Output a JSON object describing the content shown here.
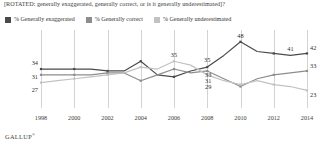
{
  "title": "[ROTATED: generally exaggerated, generally correct, or is it generally underestimated]?",
  "brand": "GALLUP",
  "brand_mark": "®",
  "colors": {
    "exaggerated": "#4a4a4a",
    "correct": "#8d8d8d",
    "underestimated": "#c2c2c2",
    "grid": "#d3d3d3",
    "text": "#2b2b2b"
  },
  "legend": [
    {
      "label": "% Generally exaggerated",
      "color": "#4a4a4a"
    },
    {
      "label": "% Generally correct",
      "color": "#8d8d8d"
    },
    {
      "label": "% Generally underestimated",
      "color": "#c2c2c2"
    }
  ],
  "chart_data": {
    "type": "line",
    "title": "[ROTATED: generally exaggerated, generally correct, or is it generally underestimated]?",
    "xlabel": "",
    "ylabel": "",
    "ylim": [
      15,
      52
    ],
    "grid": "vertical",
    "legend_position": "top",
    "x": [
      1998,
      1999,
      2000,
      2001,
      2002,
      2003,
      2004,
      2005,
      2006,
      2007,
      2008,
      2009,
      2010,
      2011,
      2012,
      2013,
      2014
    ],
    "xticks": [
      "1998",
      "2000",
      "2002",
      "2004",
      "2006",
      "2008",
      "2010",
      "2012",
      "2014"
    ],
    "series": [
      {
        "name": "% Generally exaggerated",
        "color": "#4a4a4a",
        "values": [
          34,
          34,
          34,
          34,
          33,
          33,
          38,
          31,
          30,
          33,
          35,
          41,
          48,
          43,
          42,
          41,
          42
        ],
        "labels": [
          {
            "x": 1998,
            "value": 34
          },
          {
            "x": 2008,
            "value": 35
          },
          {
            "x": 2010,
            "value": 48
          },
          {
            "x": 2013,
            "value": 41
          },
          {
            "x": 2014,
            "value": 42
          }
        ]
      },
      {
        "name": "% Generally correct",
        "color": "#8d8d8d",
        "values": [
          31,
          31,
          31,
          31,
          32,
          32,
          28,
          31,
          34,
          32,
          33,
          29,
          25,
          29,
          31,
          32,
          33
        ],
        "labels": [
          {
            "x": 1998,
            "value": 31
          },
          {
            "x": 2008,
            "value": 33
          },
          {
            "x": 2014,
            "value": 33
          }
        ]
      },
      {
        "name": "% Generally underestimated",
        "color": "#c2c2c2",
        "values": [
          27,
          28,
          29,
          30,
          31,
          32,
          35,
          34,
          38,
          36,
          31,
          28,
          26,
          28,
          26,
          25,
          23
        ],
        "labels": [
          {
            "x": 1998,
            "value": 27
          },
          {
            "x": 2006,
            "value": 35
          },
          {
            "x": 2008,
            "value": 31
          },
          {
            "x": 2014,
            "value": 23
          }
        ]
      }
    ],
    "annotations": [
      {
        "text": "29",
        "near": 2008,
        "series": "% Generally underestimated"
      }
    ]
  }
}
